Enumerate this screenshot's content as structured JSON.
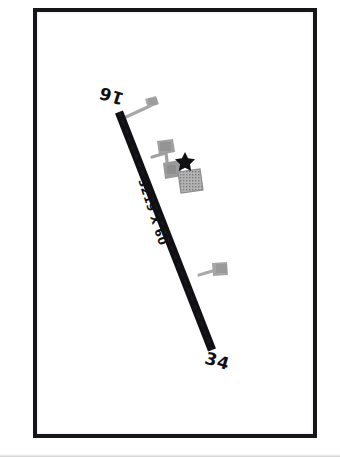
{
  "document": {
    "type": "airport-diagram",
    "title": "Airport Diagram"
  },
  "frame": {
    "border_color": "#16161a",
    "background_color": "#ffffff"
  },
  "runway": {
    "surface_color": "#101014",
    "designator_low": "16",
    "designator_high": "34",
    "dimension_label": "3219 X 60",
    "length_ft": 3219,
    "width_ft": 60,
    "orientation_deg": 160
  },
  "taxiways": {
    "color": "#9a9a9a",
    "items": [
      {
        "name": "north-taxiway-stub"
      },
      {
        "name": "mid-taxiway-stub"
      },
      {
        "name": "south-taxiway-stub"
      }
    ]
  },
  "apron": {
    "color": "#a6a6a6",
    "hatched_color": "#8f8f8f",
    "label": "ramp"
  },
  "beacon": {
    "symbol": "star",
    "color": "#111114",
    "label": "rotating beacon"
  },
  "buildings": {
    "color": "#9e9e9e",
    "count": 4
  }
}
